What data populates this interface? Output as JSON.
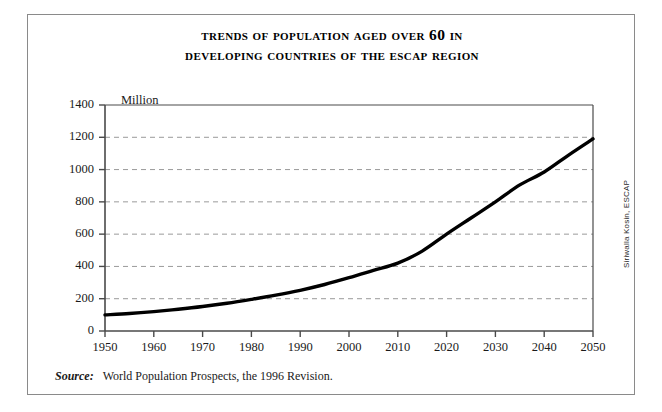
{
  "title": {
    "line1": "Trends of Population Aged over 60 in",
    "line2": "Developing Countries of the ESCAP Region"
  },
  "unit_label": "Million",
  "source": {
    "label": "Source:",
    "text": "World Population Prospects, the 1996 Revision."
  },
  "credit": "Siriwalla Kosin, ESCAP",
  "colors": {
    "line": "#000000",
    "grid": "#9a9a9a",
    "axis": "#4a4a4a",
    "border": "#8a8a8a",
    "background": "#ffffff",
    "text": "#1a1a1a"
  },
  "chart_data": {
    "type": "line",
    "title": "Trends of Population Aged over 60 in Developing Countries of the ESCAP Region",
    "xlabel": "",
    "ylabel": "Million",
    "xlim": [
      1950,
      2050
    ],
    "ylim": [
      0,
      1400
    ],
    "xticks": [
      1950,
      1960,
      1970,
      1980,
      1990,
      2000,
      2010,
      2020,
      2030,
      2040,
      2050
    ],
    "yticks": [
      0,
      200,
      400,
      600,
      800,
      1000,
      1200,
      1400
    ],
    "xtick_labels": [
      "1950",
      "1960",
      "1970",
      "1980",
      "1990",
      "2000",
      "2010",
      "2020",
      "2030",
      "2040",
      "2050"
    ],
    "ytick_labels": [
      "0",
      "200",
      "400",
      "600",
      "800",
      "1000",
      "1200",
      "1400"
    ],
    "grid": true,
    "grid_style": "dashed-horizontal",
    "legend": false,
    "series": [
      {
        "name": "Population aged over 60",
        "x": [
          1950,
          1955,
          1960,
          1965,
          1970,
          1975,
          1980,
          1985,
          1990,
          1995,
          2000,
          2005,
          2010,
          2015,
          2020,
          2025,
          2030,
          2035,
          2040,
          2045,
          2050
        ],
        "values": [
          100,
          108,
          120,
          135,
          152,
          172,
          196,
          222,
          252,
          288,
          330,
          375,
          420,
          495,
          600,
          700,
          800,
          905,
          985,
          1090,
          1190
        ]
      }
    ]
  }
}
